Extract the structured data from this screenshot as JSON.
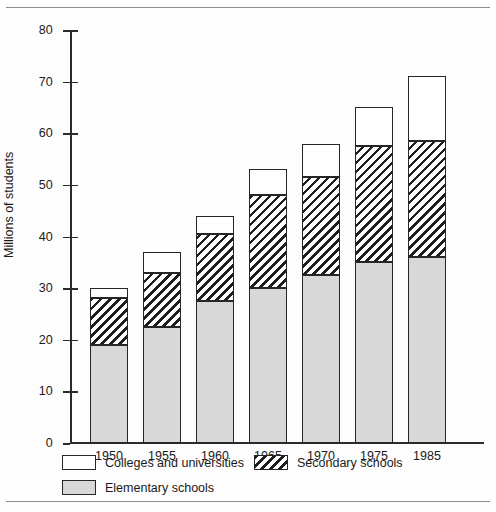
{
  "chart_data": {
    "type": "bar",
    "title": "",
    "subtitle": "",
    "xlabel": "",
    "ylabel": "Millions of students",
    "stacked": true,
    "grid": false,
    "legend_position": "bottom",
    "categories": [
      "1950",
      "1955",
      "1960",
      "1965",
      "1970",
      "1975",
      "1985"
    ],
    "ylim": [
      0,
      80
    ],
    "yticks": [
      0,
      10,
      20,
      30,
      40,
      50,
      60,
      70,
      80
    ],
    "ytick_labels": [
      "0",
      "10",
      "20",
      "30",
      "40",
      "50",
      "60",
      "70",
      "80"
    ],
    "series": [
      {
        "name": "Elementary schools",
        "pattern": "solid-gray",
        "color": "#d8d8d8",
        "values": [
          19,
          22.5,
          27.5,
          30,
          32.5,
          35,
          36
        ]
      },
      {
        "name": "Secondary schools",
        "pattern": "diagonal-hatch",
        "color": "#ffffff",
        "values": [
          9,
          10.5,
          13,
          18,
          19,
          22.5,
          22.5
        ]
      },
      {
        "name": "Colleges and universities",
        "pattern": "open-white",
        "color": "#ffffff",
        "values": [
          2,
          4,
          3.5,
          5,
          6.5,
          7.5,
          12.5
        ]
      }
    ],
    "totals": [
      30,
      37,
      44,
      53,
      58,
      65,
      71
    ]
  },
  "axis": {
    "y_title": "Millions of students"
  },
  "legend": {
    "items": [
      {
        "label": "Colleges and universities",
        "swatch": "open-white"
      },
      {
        "label": "Secondary schools",
        "swatch": "diagonal-hatch"
      },
      {
        "label": "Elementary schools",
        "swatch": "solid-gray"
      }
    ]
  }
}
